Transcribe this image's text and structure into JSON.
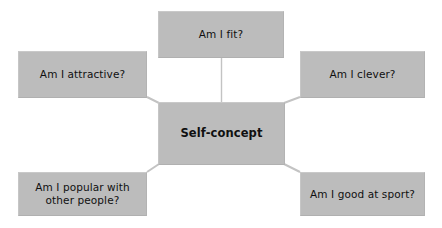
{
  "diagram": {
    "title": "Self-concept",
    "type": "hub-and-spoke concept map",
    "background_color": "#ffffff",
    "node_fill_color": "#bcbcbc",
    "node_text_color": "#101010",
    "connector_color": "#c0c0c0",
    "center": {
      "id": "self-concept",
      "label": "Self-concept"
    },
    "nodes": [
      {
        "id": "am-i-fit",
        "label": "Am I fit?"
      },
      {
        "id": "am-i-attractive",
        "label": "Am I attractive?"
      },
      {
        "id": "am-i-clever",
        "label": "Am I clever?"
      },
      {
        "id": "am-i-popular",
        "label": "Am I popular with\nother people?"
      },
      {
        "id": "am-i-good-at-sport",
        "label": "Am I good at sport?"
      }
    ],
    "connectors": [
      {
        "from": "am-i-fit",
        "to": "self-concept",
        "style": "straight-vertical"
      },
      {
        "from": "am-i-attractive",
        "to": "self-concept",
        "style": "diagonal"
      },
      {
        "from": "am-i-clever",
        "to": "self-concept",
        "style": "diagonal"
      },
      {
        "from": "am-i-popular",
        "to": "self-concept",
        "style": "diagonal"
      },
      {
        "from": "am-i-good-at-sport",
        "to": "self-concept",
        "style": "diagonal"
      }
    ]
  }
}
